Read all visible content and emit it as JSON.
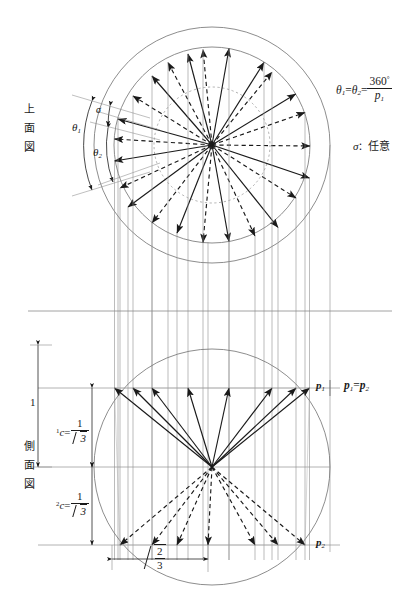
{
  "figure": {
    "type": "engineering-projection-diagram",
    "views": [
      {
        "id": "top-view",
        "label": "上面図"
      },
      {
        "id": "side-view",
        "label": "側面図"
      }
    ]
  },
  "labels": {
    "top_view_chars": [
      "上",
      "面",
      "図"
    ],
    "side_view_chars": [
      "側",
      "面",
      "図"
    ],
    "theta1": "θ",
    "theta1_sub": "1",
    "theta2": "θ",
    "theta2_sub": "2",
    "sigma": "σ",
    "p1_point": "p",
    "p1_point_sub": "1",
    "p2_point": "p",
    "p2_point_sub": "2",
    "dim_one": "1",
    "c1_prefix": "1",
    "c1_symbol": "c",
    "c2_prefix": "2",
    "c2_symbol": "c",
    "c_numerator": "1",
    "c_denominator": "3",
    "bottom_dim_numerator": "2",
    "bottom_dim_denominator": "3"
  },
  "formulas": {
    "angle_eq": {
      "lhs1": "θ",
      "lhs1_sub": "1",
      "eq1": "=",
      "lhs2": "θ",
      "lhs2_sub": "2",
      "eq2": "=",
      "numerator": "360",
      "degree": "°",
      "denominator": "p",
      "denominator_sub": "1"
    },
    "sigma_note": {
      "symbol": "σ",
      "separator": "：",
      "value": "任意"
    },
    "p_equality": {
      "lhs": "p",
      "lhs_sub": "1",
      "eq": "=",
      "rhs": "p",
      "rhs_sub": "2"
    }
  },
  "colors": {
    "ink": "#1a1a1a",
    "construction_line": "#8a8a8a",
    "circle_outline": "#6f6f6f",
    "light_guide": "#9a9a9a",
    "background": "#ffffff"
  },
  "geometry": {
    "top_view": {
      "center_x": 212,
      "center_y": 145,
      "outer_circle_r": 118,
      "inner_circle_r": 98,
      "dotted_circle_r": 58,
      "solid_spoke_count": 12,
      "dashed_spoke_count": 12,
      "spoke_step_deg": 30,
      "solid_start_deg": -80,
      "dashed_offset_deg": 14
    },
    "side_view": {
      "center_x": 212,
      "center_y": 467,
      "circle_r": 118,
      "upper_band_y": 388,
      "lower_band_y": 545,
      "solid_arrow_count": 6,
      "dashed_arrow_count": 6
    },
    "separator_y": 311,
    "dimension_left_x": 38,
    "bottom_dim_x1": 112,
    "bottom_dim_x2": 208,
    "bottom_dim_y": 559
  }
}
